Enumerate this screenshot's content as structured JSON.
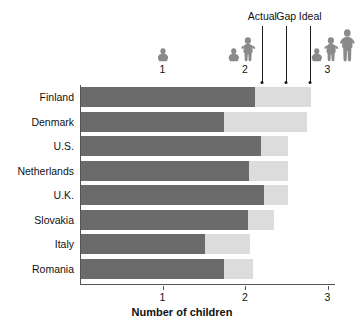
{
  "chart_data": {
    "type": "bar",
    "subtype": "stacked-horizontal",
    "title": "",
    "xlabel": "Number of children",
    "ylabel": "",
    "xlim": [
      0,
      3.08
    ],
    "xticks": [
      1,
      2,
      3
    ],
    "xticklabels": [
      "1",
      "2",
      "3"
    ],
    "grid": false,
    "orientation": "horizontal",
    "categories": [
      "Finland",
      "Denmark",
      "U.S.",
      "Netherlands",
      "U.K.",
      "Slovakia",
      "Italy",
      "Romania"
    ],
    "series": [
      {
        "name": "Actual",
        "color": "#6b6b6b",
        "values": [
          2.11,
          1.73,
          2.18,
          2.04,
          2.22,
          2.02,
          1.5,
          1.73
        ]
      },
      {
        "name": "Gap",
        "color": "#dcdcdc",
        "values": [
          0.68,
          1.01,
          0.33,
          0.47,
          0.29,
          0.32,
          0.55,
          0.35
        ]
      }
    ],
    "ideal_values": [
      2.79,
      2.74,
      2.51,
      2.51,
      2.51,
      2.34,
      2.05,
      2.08
    ],
    "annotations": [
      {
        "label": "Actual",
        "x": 2.21
      },
      {
        "label": "Gap",
        "x": 2.5
      },
      {
        "label": "Ideal",
        "x": 2.79
      }
    ],
    "legend_position": "top-callouts",
    "pictograms": [
      {
        "value": 1,
        "label": "1",
        "figures": [
          "toddler"
        ]
      },
      {
        "value": 2,
        "label": "2",
        "figures": [
          "toddler",
          "child"
        ]
      },
      {
        "value": 3,
        "label": "3",
        "figures": [
          "toddler",
          "child",
          "teen"
        ]
      }
    ]
  },
  "colors": {
    "actual_bar": "#6b6b6b",
    "gap_bar": "#dcdcdc",
    "axis": "#555555",
    "text": "#111111",
    "pictogram": "#8a8a8a",
    "background": "#ffffff"
  },
  "axis": {
    "x_title": "Number of children",
    "tick_1": "1",
    "tick_2": "2",
    "tick_3": "3"
  },
  "callouts": {
    "actual": "Actual",
    "gap": "Gap",
    "ideal": "Ideal"
  },
  "pictogram_labels": {
    "one": "1",
    "two": "2",
    "three": "3"
  },
  "y_labels": {
    "r0": "Finland",
    "r1": "Denmark",
    "r2": "U.S.",
    "r3": "Netherlands",
    "r4": "U.K.",
    "r5": "Slovakia",
    "r6": "Italy",
    "r7": "Romania"
  }
}
